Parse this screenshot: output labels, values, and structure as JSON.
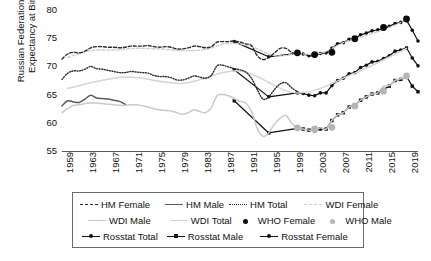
{
  "chart_data": {
    "type": "line",
    "title": "",
    "ylabel_line1": "Russian Federation Life",
    "ylabel_line2": "Expectancy at Birth",
    "xlabel": "",
    "ylim": [
      55,
      80
    ],
    "yticks": [
      80,
      75,
      70,
      65,
      60,
      55
    ],
    "xlim": [
      1959,
      2021
    ],
    "xticks": [
      1959,
      1963,
      1967,
      1971,
      1975,
      1979,
      1983,
      1987,
      1991,
      1995,
      1999,
      2003,
      2007,
      2011,
      2015,
      2019
    ],
    "grid": false,
    "legend_position": "below-plot",
    "series": [
      {
        "name": "HM Female",
        "style": "dashed",
        "color": "#2b2b2b",
        "x": [
          1959,
          1960,
          1961,
          1962,
          1963,
          1964,
          1965,
          1966,
          1967,
          1968,
          1969,
          1970,
          1971,
          1972,
          1973,
          1974,
          1975,
          1976,
          1977,
          1978,
          1979,
          1980,
          1981,
          1982,
          1983,
          1984,
          1985,
          1986,
          1987,
          1988,
          1989,
          1990,
          1991,
          1992,
          1993,
          1994,
          1995,
          1996,
          1997,
          1998,
          1999,
          2000
        ],
        "y": [
          71.3,
          72.2,
          72.5,
          72.4,
          72.7,
          73.3,
          73.5,
          73.5,
          73.4,
          73.4,
          73.3,
          73.4,
          73.6,
          73.6,
          73.6,
          73.7,
          73.5,
          73.4,
          73.5,
          73.4,
          73.1,
          73.1,
          73.3,
          73.6,
          73.5,
          73.3,
          73.5,
          74.3,
          74.4,
          74.4,
          74.5,
          74.3,
          74.0,
          73.7,
          71.9,
          71.2,
          71.6,
          72.4,
          73.2,
          73.2,
          72.5,
          72.2
        ]
      },
      {
        "name": "HM Male",
        "style": "solid",
        "color": "#5a5a5a",
        "x": [
          1959,
          1960,
          1961,
          1962,
          1963,
          1964,
          1965,
          1966,
          1967,
          1968,
          1969,
          1970
        ],
        "y": [
          63.0,
          63.9,
          63.7,
          63.6,
          64.2,
          64.9,
          64.4,
          64.3,
          64.2,
          64.0,
          63.8,
          63.3
        ]
      },
      {
        "name": "HM Total",
        "style": "dotted",
        "color": "#2b2b2b",
        "x": [
          1959,
          1960,
          1961,
          1962,
          1963,
          1964,
          1965,
          1966,
          1967,
          1968,
          1969,
          1970,
          1971,
          1972,
          1973,
          1974,
          1975,
          1976,
          1977,
          1978,
          1979,
          1980,
          1981,
          1982,
          1983,
          1984,
          1985,
          1986,
          1987,
          1988,
          1989,
          1990,
          1991,
          1992,
          1993,
          1994,
          1995,
          1996,
          1997,
          1998,
          1999,
          2000
        ],
        "y": [
          67.7,
          68.8,
          69.2,
          69.2,
          69.5,
          70.0,
          69.6,
          69.5,
          69.3,
          69.1,
          68.9,
          68.9,
          69.1,
          69.0,
          68.9,
          68.8,
          68.4,
          68.2,
          68.2,
          68.0,
          67.6,
          67.6,
          67.9,
          68.3,
          68.1,
          67.9,
          68.4,
          70.1,
          70.2,
          69.9,
          69.6,
          69.4,
          69.0,
          67.9,
          65.9,
          64.2,
          64.6,
          65.9,
          66.9,
          67.1,
          66.2,
          65.5
        ]
      },
      {
        "name": "WDI Female",
        "style": "dashed",
        "color": "#cfcfcf",
        "x": [
          1960,
          1964,
          1968,
          1972,
          1976,
          1980,
          1984,
          1988,
          1992,
          1996,
          2000,
          2004,
          2008,
          2012,
          2016,
          2019
        ],
        "y": [
          71.6,
          72.8,
          72.9,
          73.2,
          73.1,
          72.8,
          73.0,
          74.1,
          73.5,
          71.9,
          72.2,
          72.3,
          74.2,
          75.5,
          76.9,
          78.2
        ]
      },
      {
        "name": "WDI Male",
        "style": "solid",
        "color": "#c9c9c9",
        "x": [
          1959,
          1960,
          1961,
          1962,
          1963,
          1964,
          1965,
          1966,
          1967,
          1968,
          1969,
          1970,
          1971,
          1972,
          1973,
          1974,
          1975,
          1976,
          1977,
          1978,
          1979,
          1980,
          1981,
          1982,
          1983,
          1984,
          1985,
          1986,
          1987,
          1988,
          1989,
          1990,
          1991,
          1992,
          1993,
          1994,
          1995,
          1996,
          1997,
          1998,
          1999,
          2000,
          2001,
          2002,
          2003,
          2004,
          2005,
          2006,
          2007,
          2008,
          2009,
          2010,
          2011,
          2012,
          2013,
          2014,
          2015,
          2016,
          2017,
          2018,
          2019
        ],
        "y": [
          61.8,
          62.5,
          63.1,
          63.2,
          63.4,
          63.5,
          63.5,
          63.4,
          63.3,
          63.2,
          63.1,
          63.1,
          63.2,
          63.2,
          63.0,
          62.8,
          62.5,
          62.3,
          62.2,
          62.1,
          61.8,
          61.5,
          61.8,
          62.3,
          62.0,
          61.8,
          62.7,
          64.8,
          65.0,
          64.8,
          64.3,
          63.8,
          63.5,
          62.0,
          59.0,
          57.6,
          58.2,
          59.8,
          60.8,
          61.3,
          59.9,
          59.1,
          58.9,
          58.7,
          58.6,
          59.1,
          58.9,
          60.4,
          61.4,
          61.8,
          62.8,
          63.1,
          64.0,
          64.6,
          65.1,
          65.3,
          66.5,
          66.6,
          67.5,
          67.8,
          68.2
        ]
      },
      {
        "name": "WDI Total",
        "style": "solid",
        "color": "#d4d4d4",
        "x": [
          1960,
          1970,
          1980,
          1990,
          2000,
          2010,
          2019
        ],
        "y": [
          66.1,
          68.1,
          67.0,
          69.2,
          65.3,
          68.8,
          73.2
        ]
      },
      {
        "name": "WHO Female",
        "style": "marker-circle",
        "color": "#0b0b0b",
        "x": [
          2000,
          2003,
          2006,
          2010,
          2015,
          2019
        ],
        "y": [
          72.4,
          72.1,
          72.5,
          74.9,
          76.9,
          78.4
        ]
      },
      {
        "name": "WHO Male",
        "style": "marker-circle",
        "color": "#b5b5b5",
        "x": [
          2000,
          2003,
          2006,
          2010,
          2015,
          2019
        ],
        "y": [
          59.1,
          58.9,
          59.2,
          63.0,
          65.6,
          68.3
        ]
      },
      {
        "name": "Rosstat Total",
        "style": "line-marker-dot",
        "color": "#111111",
        "x": [
          1989,
          1995,
          2000,
          2001,
          2002,
          2003,
          2004,
          2005,
          2006,
          2007,
          2008,
          2009,
          2010,
          2011,
          2012,
          2013,
          2014,
          2015,
          2016,
          2017,
          2018,
          2019,
          2020,
          2021
        ],
        "y": [
          69.4,
          64.6,
          65.3,
          65.2,
          64.9,
          64.8,
          65.3,
          65.3,
          66.6,
          67.5,
          67.9,
          68.7,
          68.9,
          69.8,
          70.2,
          70.8,
          70.9,
          71.4,
          71.9,
          72.7,
          72.9,
          73.3,
          71.5,
          70.1
        ]
      },
      {
        "name": "Rosstat Male",
        "style": "line-marker-square",
        "color": "#111111",
        "x": [
          1989,
          1995,
          2000,
          2001,
          2002,
          2003,
          2004,
          2005,
          2006,
          2007,
          2008,
          2009,
          2010,
          2011,
          2012,
          2013,
          2014,
          2015,
          2016,
          2017,
          2018,
          2019,
          2020,
          2021
        ],
        "y": [
          63.9,
          58.2,
          59.0,
          58.9,
          58.7,
          58.6,
          58.9,
          58.9,
          60.4,
          61.4,
          61.8,
          62.8,
          63.1,
          64.0,
          64.6,
          65.1,
          65.3,
          65.9,
          66.5,
          67.5,
          67.7,
          68.2,
          66.5,
          65.5
        ]
      },
      {
        "name": "Rosstat Female",
        "style": "line-marker-dot",
        "color": "#111111",
        "x": [
          1989,
          1995,
          2000,
          2001,
          2002,
          2003,
          2004,
          2005,
          2006,
          2007,
          2008,
          2009,
          2010,
          2011,
          2012,
          2013,
          2014,
          2015,
          2016,
          2017,
          2018,
          2019,
          2020,
          2021
        ],
        "y": [
          74.4,
          71.7,
          72.3,
          72.2,
          71.9,
          71.8,
          72.3,
          72.4,
          73.2,
          74.0,
          74.2,
          74.8,
          74.9,
          75.6,
          75.9,
          76.3,
          76.5,
          76.7,
          77.1,
          77.6,
          77.8,
          78.2,
          76.4,
          74.5
        ]
      }
    ]
  },
  "axes": {
    "y_tick_labels": [
      "80",
      "75",
      "70",
      "65",
      "60",
      "55"
    ],
    "x_tick_labels": [
      "1959",
      "1963",
      "1967",
      "1971",
      "1975",
      "1979",
      "1983",
      "1987",
      "1991",
      "1995",
      "1999",
      "2003",
      "2007",
      "2011",
      "2015",
      "2019"
    ]
  },
  "legend": {
    "rows": [
      [
        {
          "label": "HM Female",
          "glyph": "dashed-dark-line-icon"
        },
        {
          "label": "HM Male",
          "glyph": "solid-gray-line-icon"
        },
        {
          "label": "HM Total",
          "glyph": "dotted-dark-line-icon"
        },
        {
          "label": "WDI Female",
          "glyph": "dashed-light-line-icon"
        }
      ],
      [
        {
          "label": "WDI Male",
          "glyph": "solid-light-line-icon"
        },
        {
          "label": "WDI Total",
          "glyph": "solid-light2-line-icon"
        },
        {
          "label": "WHO Female",
          "glyph": "black-dot-marker-icon"
        },
        {
          "label": "WHO Male",
          "glyph": "gray-dot-marker-icon"
        }
      ],
      [
        {
          "label": "Rosstat Total",
          "glyph": "line-dot-marker-icon"
        },
        {
          "label": "Rosstat Male",
          "glyph": "line-square-marker-icon"
        },
        {
          "label": "Rosstat Female",
          "glyph": "line-dot-marker-icon"
        }
      ]
    ]
  },
  "colors": {
    "dark": "#2b2b2b",
    "gray": "#5a5a5a",
    "light": "#c9c9c9",
    "marker_black": "#0b0b0b",
    "marker_gray": "#b5b5b5",
    "axis": "#5a5a5a",
    "legend_border": "#6b6b6b"
  }
}
